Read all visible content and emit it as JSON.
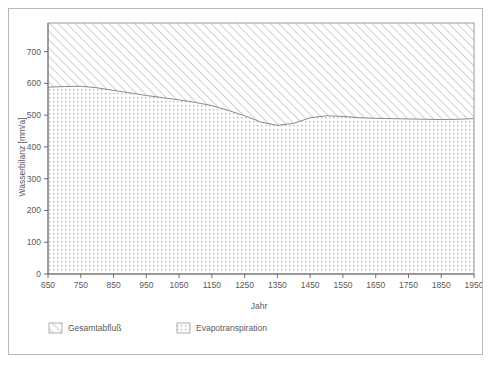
{
  "chart_data": {
    "type": "area",
    "title": "",
    "xlabel": "Jahr",
    "ylabel": "Wasserbilanz [mm/a]",
    "xlim": [
      650,
      1950
    ],
    "ylim": [
      0,
      790
    ],
    "xticks": [
      650,
      750,
      850,
      950,
      1050,
      1150,
      1250,
      1350,
      1450,
      1550,
      1650,
      1750,
      1850,
      1950
    ],
    "yticks": [
      0,
      100,
      200,
      300,
      400,
      500,
      600,
      700
    ],
    "grid": false,
    "legend_position": "bottom",
    "stacked": true,
    "total_top": 790,
    "x": [
      650,
      700,
      750,
      800,
      850,
      900,
      950,
      1000,
      1050,
      1100,
      1150,
      1200,
      1250,
      1300,
      1350,
      1400,
      1450,
      1500,
      1550,
      1600,
      1650,
      1700,
      1750,
      1800,
      1850,
      1900,
      1950
    ],
    "series": [
      {
        "name": "Evapotranspiration",
        "pattern": "dotted",
        "values": [
          588,
          590,
          591,
          586,
          578,
          570,
          562,
          555,
          548,
          540,
          530,
          515,
          498,
          478,
          468,
          474,
          492,
          498,
          496,
          492,
          490,
          489,
          488,
          487,
          486,
          487,
          489
        ]
      },
      {
        "name": "Gesamtabfluß",
        "pattern": "diagonal-hatch",
        "values": [
          202,
          200,
          199,
          204,
          212,
          220,
          228,
          235,
          242,
          250,
          260,
          275,
          292,
          312,
          322,
          316,
          298,
          292,
          294,
          298,
          300,
          301,
          302,
          303,
          304,
          303,
          301
        ]
      }
    ],
    "legend": [
      {
        "label": "Gesamtabfluß",
        "pattern": "diagonal-hatch"
      },
      {
        "label": "Evapotranspiration",
        "pattern": "dotted"
      }
    ],
    "colors": {
      "axis": "#6d6d6d",
      "frame": "#b8b8b8",
      "plot_border": "#9a9a9a",
      "curve": "#8a8a8a",
      "hatch": "#c9c9c9",
      "dots": "#b5b5b5",
      "text": "#5a5a5a",
      "background": "#ffffff"
    }
  }
}
